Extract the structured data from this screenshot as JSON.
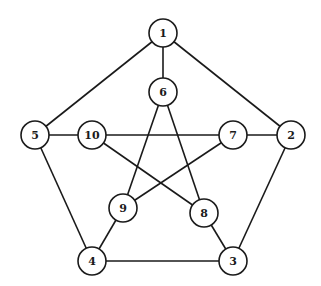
{
  "graph": {
    "name": "Petersen graph",
    "node_radius": 14,
    "colors": {
      "stroke": "#1a1a1a",
      "fill": "#ffffff",
      "background": "#ffffff"
    },
    "nodes": [
      {
        "id": "1",
        "label": "1",
        "x": 163,
        "y": 33
      },
      {
        "id": "2",
        "label": "2",
        "x": 291,
        "y": 135
      },
      {
        "id": "3",
        "label": "3",
        "x": 233,
        "y": 261
      },
      {
        "id": "4",
        "label": "4",
        "x": 92,
        "y": 261
      },
      {
        "id": "5",
        "label": "5",
        "x": 35,
        "y": 135
      },
      {
        "id": "6",
        "label": "6",
        "x": 163,
        "y": 92
      },
      {
        "id": "7",
        "label": "7",
        "x": 233,
        "y": 135
      },
      {
        "id": "8",
        "label": "8",
        "x": 204,
        "y": 213
      },
      {
        "id": "9",
        "label": "9",
        "x": 123,
        "y": 208
      },
      {
        "id": "10",
        "label": "10",
        "x": 92,
        "y": 135
      }
    ],
    "edges": [
      [
        "1",
        "2"
      ],
      [
        "2",
        "3"
      ],
      [
        "3",
        "4"
      ],
      [
        "4",
        "5"
      ],
      [
        "5",
        "1"
      ],
      [
        "1",
        "6"
      ],
      [
        "2",
        "7"
      ],
      [
        "3",
        "8"
      ],
      [
        "4",
        "9"
      ],
      [
        "5",
        "10"
      ],
      [
        "6",
        "8"
      ],
      [
        "6",
        "9"
      ],
      [
        "7",
        "9"
      ],
      [
        "7",
        "10"
      ],
      [
        "8",
        "10"
      ]
    ]
  }
}
